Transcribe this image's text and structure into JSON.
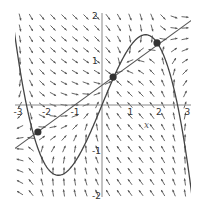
{
  "figure": {
    "type": "direction_field",
    "xlim": [
      -3,
      3
    ],
    "ylim": [
      -2,
      2
    ],
    "axes": {
      "x_ticks": [
        {
          "value": -3,
          "label": "-3"
        },
        {
          "value": -2,
          "label": "-2"
        },
        {
          "value": -1,
          "label": "-1"
        },
        {
          "value": 1,
          "label": "1"
        },
        {
          "value": 2,
          "label": "2"
        },
        {
          "value": 3,
          "label": "3"
        }
      ],
      "y_ticks": [
        {
          "value": 2,
          "label": "2"
        },
        {
          "value": 1,
          "label": "1"
        },
        {
          "value": -1,
          "label": "-1"
        },
        {
          "value": -2,
          "label": "-2"
        }
      ],
      "axis_letter": "x"
    },
    "nullclines": {
      "cubic": {
        "coefficient": -0.218,
        "roots": [
          -2.65,
          0,
          2.65
        ],
        "color": "#444444"
      },
      "line": {
        "slope": 0.46,
        "intercept": 0.44,
        "color": "#555555"
      }
    },
    "equilibria": [
      {
        "x": -2.25,
        "y": -0.6
      },
      {
        "x": 0.39,
        "y": 0.62
      },
      {
        "x": 1.93,
        "y": 1.38
      }
    ],
    "colors": {
      "arrows": "#555555",
      "axes": "#888888",
      "points": "#333333"
    }
  }
}
